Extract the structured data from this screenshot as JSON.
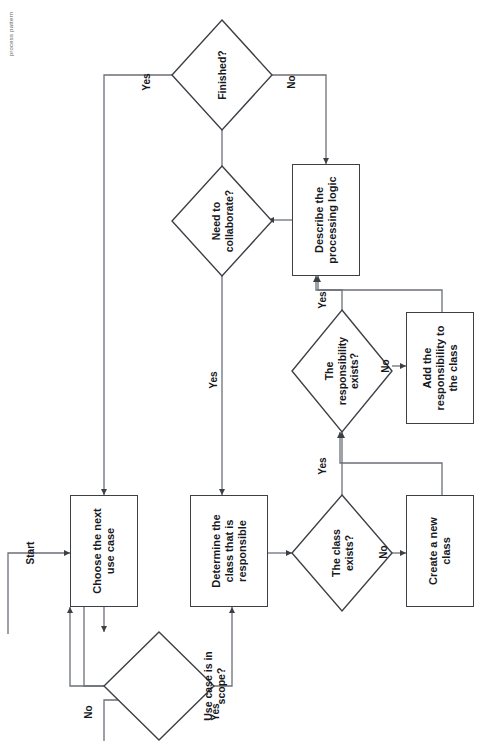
{
  "caption": {
    "text": "process pattern"
  },
  "diagram": {
    "orientation": "rotated-90-ccw",
    "stroke_color": "#3c3f44",
    "text_color": "#16181c",
    "background": "#ffffff",
    "start_label": "Start",
    "nodes": [
      {
        "id": "choose",
        "type": "process",
        "label": "Choose the next\nuse case"
      },
      {
        "id": "inscope",
        "type": "decision",
        "label": "Use case is in\nscope?"
      },
      {
        "id": "determine",
        "type": "process",
        "label": "Determine the\nclass that is\nresponsible"
      },
      {
        "id": "classexists",
        "type": "decision",
        "label": "The class\nexists?"
      },
      {
        "id": "createclass",
        "type": "process",
        "label": "Create a new\nclass"
      },
      {
        "id": "respexists",
        "type": "decision",
        "label": "The\nresponsibility\nexists?"
      },
      {
        "id": "addresp",
        "type": "process",
        "label": "Add the\nresponsibility to\nthe class"
      },
      {
        "id": "describe",
        "type": "process",
        "label": "Describe the\nprocessing logic"
      },
      {
        "id": "collaborate",
        "type": "decision",
        "label": "Need to\ncollaborate?"
      },
      {
        "id": "finished",
        "type": "decision",
        "label": "Finished?"
      }
    ],
    "edge_labels": [
      {
        "id": "inscope-no",
        "text": "No"
      },
      {
        "id": "inscope-yes",
        "text": "Yes"
      },
      {
        "id": "classexists-no",
        "text": "No"
      },
      {
        "id": "classexists-yes",
        "text": "Yes"
      },
      {
        "id": "respexists-no",
        "text": "No"
      },
      {
        "id": "respexists-yes",
        "text": "Yes"
      },
      {
        "id": "collaborate-yes",
        "text": "Yes"
      },
      {
        "id": "finished-no",
        "text": "No"
      },
      {
        "id": "finished-yes",
        "text": "Yes"
      }
    ]
  }
}
